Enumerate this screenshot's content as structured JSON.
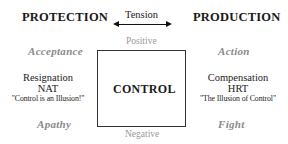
{
  "diagram": {
    "left_title": "PROTECTION",
    "right_title": "PRODUCTION",
    "axis_label": "Tension",
    "arrow": "bidirectional",
    "top_axis": "Positive",
    "bottom_axis": "Negative",
    "center_box": "CONTROL",
    "quadrants": {
      "top_left": "Acceptance",
      "top_right": "Action",
      "bottom_left": "Apathy",
      "bottom_right": "Fight"
    },
    "left_column": {
      "line1": "Resignation",
      "line2": "NAT",
      "line3": "\"Control is an Illusion!\""
    },
    "right_column": {
      "line1": "Compensation",
      "line2": "HRT",
      "line3": "\"The Illusion of Control\""
    },
    "colors": {
      "text": "#1a1a1a",
      "muted": "#8a8a8a",
      "axis": "#9a9a9a",
      "border": "#333333"
    }
  }
}
